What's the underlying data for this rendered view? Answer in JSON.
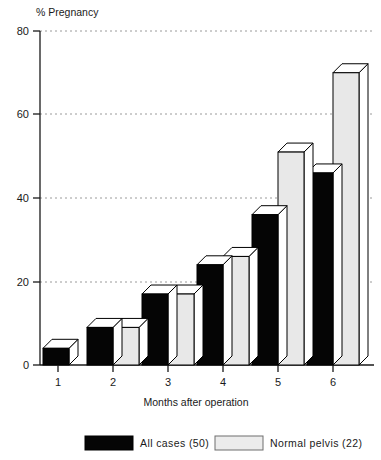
{
  "chart_data": {
    "type": "bar",
    "title": "",
    "xlabel": "Months after operation",
    "ylabel": "% Pregnancy",
    "categories": [
      "1",
      "2",
      "3",
      "4",
      "5",
      "6"
    ],
    "series": [
      {
        "name": "All cases (50)",
        "color": "#050505",
        "values": [
          4,
          9,
          17,
          24,
          36,
          46
        ]
      },
      {
        "name": "Normal pelvis (22)",
        "color": "#e8e8e8",
        "values": [
          null,
          9,
          17,
          26,
          51,
          70
        ]
      }
    ],
    "ylim": [
      0,
      80
    ],
    "yticks": [
      0,
      20,
      40,
      60,
      80
    ],
    "ytick_labels": [
      "0",
      "20",
      "40",
      "60",
      "80"
    ],
    "grid": "horizontal-dashed",
    "legend_position": "bottom",
    "style": "3d-extruded-bars"
  },
  "axes": {
    "y_axis_title": "% Pregnancy",
    "x_axis_title": "Months after operation",
    "y_tick_0": "0",
    "y_tick_20": "20",
    "y_tick_40": "40",
    "y_tick_60": "60",
    "y_tick_80": "80",
    "x_tick_1": "1",
    "x_tick_2": "2",
    "x_tick_3": "3",
    "x_tick_4": "4",
    "x_tick_5": "5",
    "x_tick_6": "6"
  },
  "legend": {
    "items": [
      {
        "label": "All cases  (50)",
        "swatch": "black-filled-swatch"
      },
      {
        "label": "Normal pelvis  (22)",
        "swatch": "light-gray-swatch"
      }
    ]
  }
}
